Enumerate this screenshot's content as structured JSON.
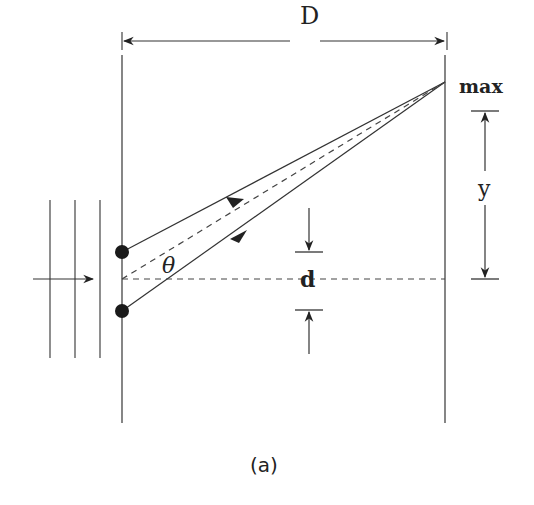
{
  "diagram": {
    "labels": {
      "distance": "D",
      "maximum": "max",
      "height": "y",
      "slit_separation": "d",
      "angle": "θ",
      "caption": "(a)"
    },
    "colors": {
      "line": "#333333",
      "slit": "#1a1a1a",
      "background": "#ffffff"
    }
  }
}
